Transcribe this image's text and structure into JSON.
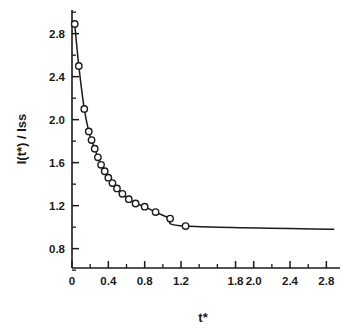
{
  "figure": {
    "background_color": "#ffffff",
    "ink_color": "#1a1a1a",
    "marker_fill": "#ffffff"
  },
  "chart_data": {
    "type": "line",
    "title": "",
    "subtitle": "",
    "xlabel": "t*",
    "ylabel": "I(t*) / Iss",
    "xlim": [
      0,
      2.95
    ],
    "ylim": [
      0.62,
      3.02
    ],
    "grid": false,
    "legend": null,
    "marker_style": "open-circle",
    "line_style": "solid",
    "x_ticks_major": [
      0,
      0.4,
      0.8,
      1.2,
      1.8,
      2.0,
      2.4,
      2.8
    ],
    "x_tick_labels": [
      "0",
      "0.4",
      "0.8",
      "1.2",
      "1.8",
      "2.0",
      "2.4",
      "2.8"
    ],
    "x_ticks_minor": [
      0.2,
      0.6,
      1.0,
      1.4,
      1.6,
      2.2,
      2.6
    ],
    "y_ticks_major": [
      0.8,
      1.2,
      1.6,
      2.0,
      2.4,
      2.8
    ],
    "y_tick_labels": [
      "0.8",
      "1.2",
      "1.6",
      "2.0",
      "2.4",
      "2.8"
    ],
    "y_ticks_minor": [
      0.6,
      1.0,
      1.4,
      1.8,
      2.2,
      2.6,
      3.0
    ],
    "asymptote_value": 0.98,
    "series": [
      {
        "name": "I(t*)/Iss",
        "x": [
          0.03,
          0.075,
          0.135,
          0.185,
          0.215,
          0.25,
          0.285,
          0.32,
          0.36,
          0.4,
          0.445,
          0.495,
          0.555,
          0.625,
          0.7,
          0.8,
          0.92,
          1.08,
          1.25
        ],
        "values": [
          2.89,
          2.5,
          2.1,
          1.89,
          1.81,
          1.73,
          1.65,
          1.58,
          1.52,
          1.46,
          1.41,
          1.36,
          1.31,
          1.26,
          1.22,
          1.19,
          1.14,
          1.08,
          1.01
        ]
      }
    ],
    "tail_line": {
      "x_start": 1.25,
      "x_end": 2.88,
      "y": 0.98
    }
  }
}
